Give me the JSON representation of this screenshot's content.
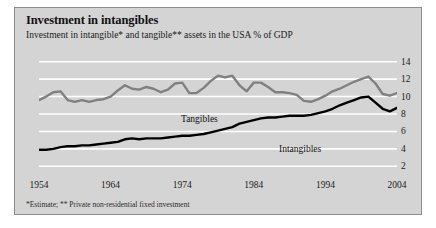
{
  "figure": {
    "title": "Investment in intangibles",
    "subtitle": "Investment in intangible* and tangible** assets in the USA % of GDP",
    "footnote": "*Estimate; ** Private non-residential fixed investment",
    "background_color": "#d4d4d4",
    "border_color": "#8d8d8d",
    "gridline_color": "#ffffff"
  },
  "chart_data": {
    "type": "line",
    "title": "Investment in intangibles",
    "subtitle": "Investment in intangible* and tangible** assets in the USA % of GDP",
    "xlabel": "",
    "ylabel": "% of GDP",
    "xlim": [
      1954,
      2004
    ],
    "ylim": [
      1,
      15
    ],
    "yticks": [
      2,
      4,
      6,
      8,
      10,
      12,
      14
    ],
    "xticks": [
      1954,
      1964,
      1974,
      1984,
      1994,
      2004
    ],
    "grid": "horizontal",
    "legend": "inline-labels",
    "x": [
      1954,
      1955,
      1956,
      1957,
      1958,
      1959,
      1960,
      1961,
      1962,
      1963,
      1964,
      1965,
      1966,
      1967,
      1968,
      1969,
      1970,
      1971,
      1972,
      1973,
      1974,
      1975,
      1976,
      1977,
      1978,
      1979,
      1980,
      1981,
      1982,
      1983,
      1984,
      1985,
      1986,
      1987,
      1988,
      1989,
      1990,
      1991,
      1992,
      1993,
      1994,
      1995,
      1996,
      1997,
      1998,
      1999,
      2000,
      2001,
      2002,
      2003,
      2004
    ],
    "series": [
      {
        "name": "Tangibles",
        "color": "#808080",
        "label": "Tangibles",
        "values": [
          9.6,
          10.0,
          10.5,
          10.6,
          9.6,
          9.4,
          9.6,
          9.4,
          9.6,
          9.7,
          10.0,
          10.7,
          11.3,
          10.9,
          10.8,
          11.1,
          10.9,
          10.5,
          10.8,
          11.5,
          11.6,
          10.4,
          10.4,
          11.0,
          11.8,
          12.4,
          12.2,
          12.4,
          11.3,
          10.6,
          11.6,
          11.6,
          11.1,
          10.5,
          10.5,
          10.4,
          10.2,
          9.5,
          9.4,
          9.7,
          10.1,
          10.6,
          10.9,
          11.3,
          11.7,
          12.0,
          12.3,
          11.5,
          10.3,
          10.1,
          10.4
        ]
      },
      {
        "name": "Intangibles",
        "color": "#000000",
        "label": "Intangibles",
        "values": [
          3.9,
          3.9,
          4.0,
          4.2,
          4.3,
          4.3,
          4.4,
          4.4,
          4.5,
          4.6,
          4.7,
          4.8,
          5.1,
          5.2,
          5.1,
          5.2,
          5.2,
          5.2,
          5.3,
          5.4,
          5.5,
          5.5,
          5.6,
          5.7,
          5.9,
          6.1,
          6.3,
          6.5,
          6.9,
          7.1,
          7.3,
          7.5,
          7.6,
          7.6,
          7.7,
          7.8,
          7.8,
          7.8,
          7.9,
          8.1,
          8.3,
          8.6,
          9.0,
          9.3,
          9.6,
          9.9,
          10.0,
          9.3,
          8.6,
          8.3,
          8.7
        ]
      }
    ]
  },
  "axis": {
    "yticks": [
      "14",
      "12",
      "10",
      "8",
      "6",
      "4",
      "2"
    ],
    "xticks": [
      "1954",
      "1964",
      "1974",
      "1984",
      "1994",
      "2004"
    ]
  }
}
